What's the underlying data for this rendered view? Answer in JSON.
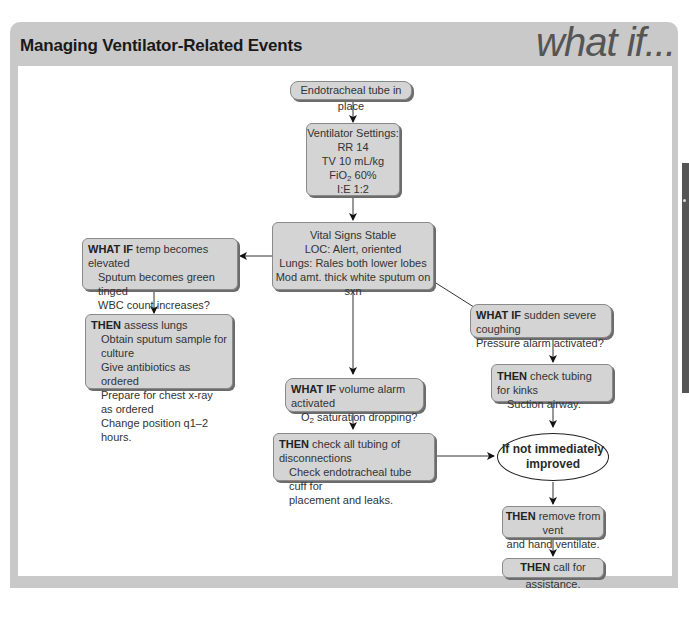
{
  "header": {
    "title": "Managing Ventilator-Related Events",
    "brand_text": "what if..."
  },
  "nodes": {
    "start": {
      "text": "Endotracheal tube in place"
    },
    "settings": {
      "heading": "Ventilator Settings:",
      "rr": "RR 14",
      "tv": "TV 10 mL/kg",
      "fio2_prefix": "FiO",
      "fio2_sub": "2",
      "fio2_value": " 60%",
      "ie": "I:E 1:2"
    },
    "status": {
      "line1": "Vital Signs Stable",
      "line2": "LOC: Alert, oriented",
      "line3": "Lungs: Rales both lower lobes",
      "line4": "Mod amt. thick white sputum on sxn"
    },
    "whatif_infection": {
      "keyword": "WHAT IF",
      "line1": " temp becomes elevated",
      "line2": "Sputum becomes green tinged",
      "line3": "WBC count increases?"
    },
    "then_infection": {
      "keyword": "THEN",
      "line1": " assess lungs",
      "line2": "Obtain sputum sample for culture",
      "line3": "Give antibiotics as ordered",
      "line4": "Prepare for chest x-ray as ordered",
      "line5": "Change position q1–2 hours."
    },
    "whatif_volume": {
      "keyword": "WHAT IF",
      "line1": " volume alarm activated",
      "line2_prefix": "O",
      "line2_sub": "2",
      "line2_rest": " saturation dropping?"
    },
    "then_volume": {
      "keyword": "THEN",
      "line1": " check all tubing of disconnections",
      "line2": "Check endotracheal tube cuff for",
      "line3": "placement and leaks."
    },
    "whatif_pressure": {
      "keyword": "WHAT IF",
      "line1": " sudden severe coughing",
      "line2": "Pressure alarm activated?"
    },
    "then_pressure": {
      "keyword": "THEN",
      "line1": " check tubing for kinks",
      "line2": "Suction airway."
    },
    "decision": {
      "line1": "If not immediately",
      "line2": "improved"
    },
    "then_remove": {
      "keyword": "THEN",
      "line1": " remove from vent",
      "line2": "and hand ventilate."
    },
    "then_assist": {
      "keyword": "THEN",
      "line1": " call for assistance."
    }
  },
  "colors": {
    "frame": "#c9c9c9",
    "box_fill": "#d4d4d4",
    "side_tab": "#555555"
  }
}
